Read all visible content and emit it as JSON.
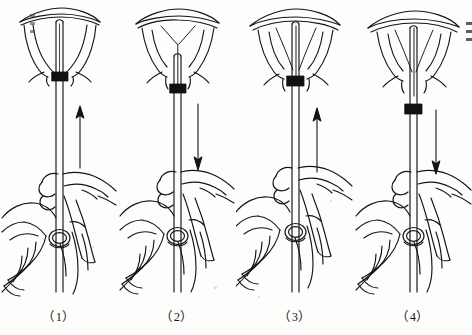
{
  "figure": {
    "panel_count": 4,
    "line_color": "#141414",
    "fill_color": "#ffffff",
    "marker_color": "#111111",
    "background_color": "#fdfdfc",
    "caption_color": "#1a1a1a"
  },
  "panels": [
    {
      "id": "panel-1",
      "caption": "（1）",
      "step_number": "1",
      "arrow_direction": "up",
      "arrow_label": "push-up-arrow",
      "flange_position": "at-cervix",
      "tube_depth": "inserted-to-fundus",
      "iud_state": "loaded-in-tube"
    },
    {
      "id": "panel-2",
      "caption": "（2）",
      "step_number": "2",
      "arrow_direction": "down",
      "arrow_label": "pull-down-arrow",
      "flange_position": "below-cervix",
      "tube_depth": "withdrawn",
      "iud_state": "arms-released"
    },
    {
      "id": "panel-3",
      "caption": "（3）",
      "step_number": "3",
      "arrow_direction": "up",
      "arrow_label": "push-up-arrow",
      "flange_position": "at-cervix",
      "tube_depth": "re-advanced-to-fundus",
      "iud_state": "arms-open-at-fundus"
    },
    {
      "id": "panel-4",
      "caption": "（4）",
      "step_number": "4",
      "arrow_direction": "down",
      "arrow_label": "pull-down-arrow",
      "flange_position": "far-below-cervix",
      "tube_depth": "fully-withdrawn",
      "iud_state": "placed-in-uterus"
    }
  ]
}
